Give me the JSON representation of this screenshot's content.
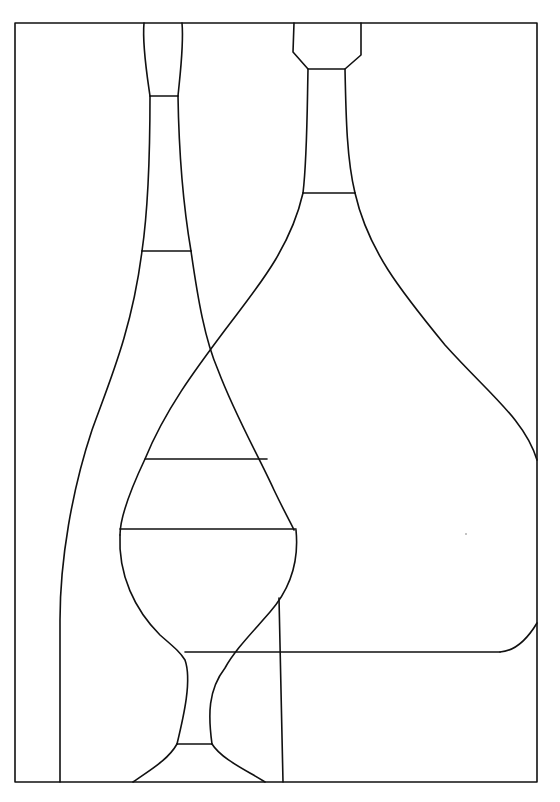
{
  "artwork": {
    "subject": "line drawing of two bottles and a wine glass",
    "style": "black outline on white, stained-glass pattern",
    "colors": {
      "background": "#ffffff",
      "stroke": "#111111"
    },
    "frame": {
      "x": 15,
      "y": 23,
      "width": 522,
      "height": 759
    }
  }
}
